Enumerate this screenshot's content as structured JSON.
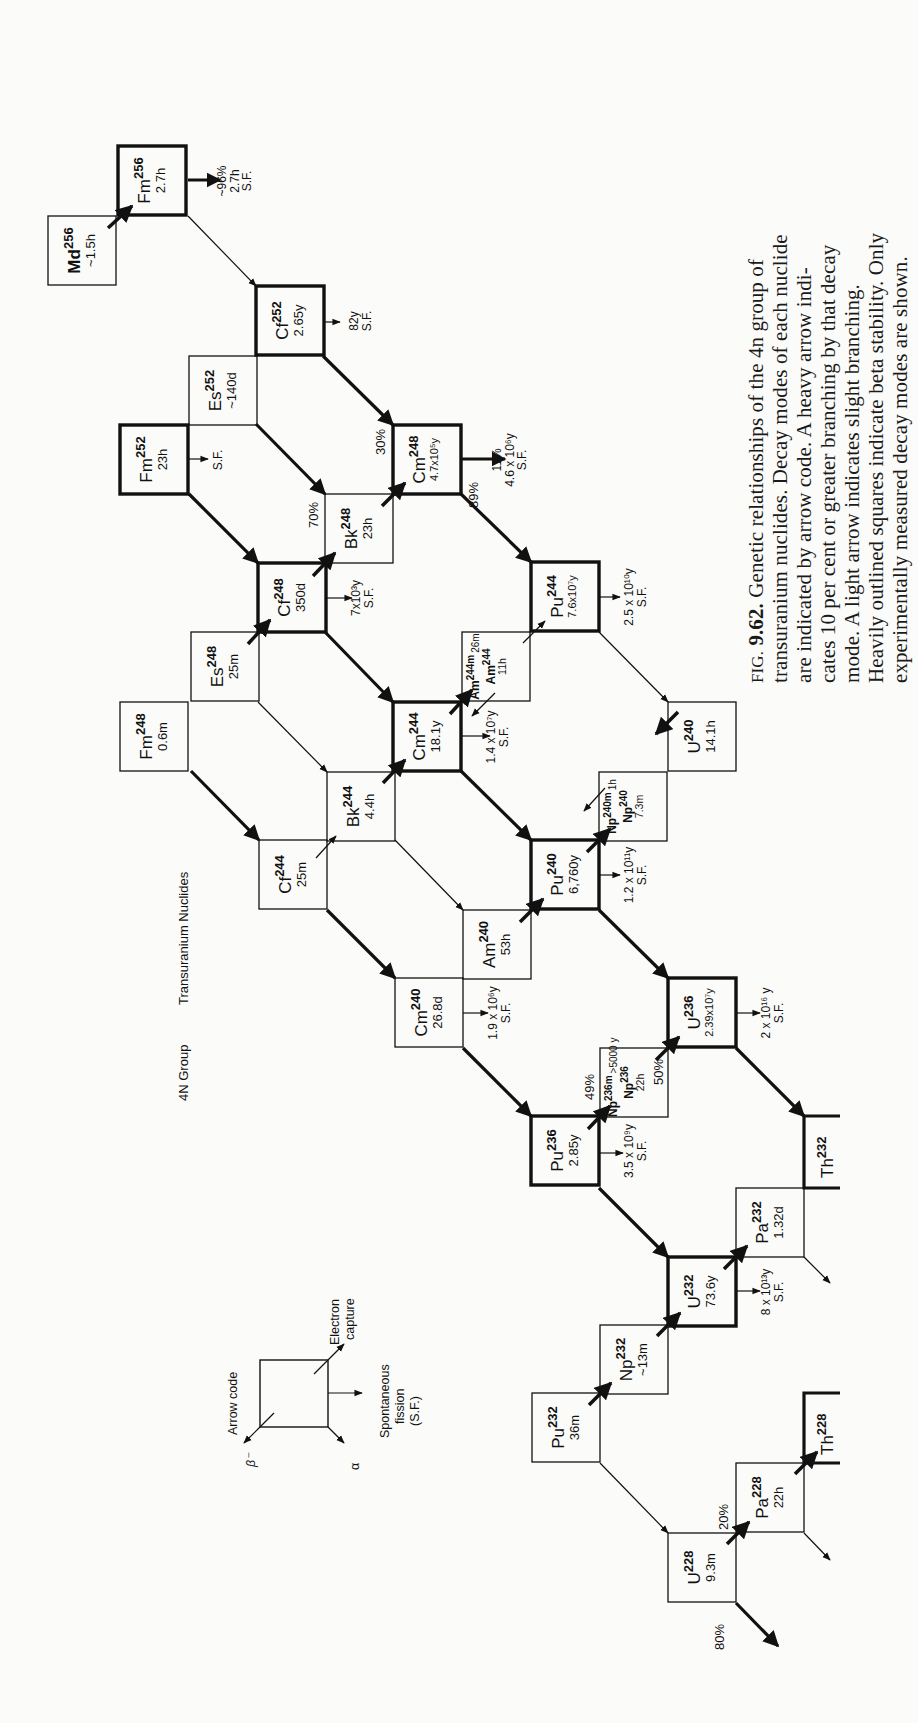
{
  "header": {
    "group_label": "4N Group",
    "title": "Transuranium Nuclides"
  },
  "legend": {
    "title": "Arrow code",
    "beta_minus": "β⁻",
    "alpha": "α",
    "spontaneous_fission": [
      "Spontaneous",
      "fission",
      "(S.F.)"
    ],
    "electron_capture": [
      "Electron",
      "capture"
    ]
  },
  "caption": {
    "fig_prefix": "FIG.",
    "fig_number": "9.62.",
    "lines": [
      "Genetic relationships of the 4n group of",
      "transuranium nuclides.   Decay modes of each nuclide",
      "are indicated by arrow code.   A heavy arrow indi-",
      "cates 10 per cent or greater branching by that decay",
      "mode.   A light arrow indicates slight branching.",
      "Heavily outlined squares indicate beta stability.  Only",
      "experimentally measured decay modes are shown."
    ]
  },
  "nuclides": [
    {
      "id": "md256",
      "symbol": "Md",
      "mass": "256",
      "halflife": "~1.5h",
      "heavy": false,
      "x": 48,
      "y": 216
    },
    {
      "id": "fm256",
      "symbol": "Fm",
      "mass": "256",
      "halflife": "2.7h",
      "heavy": true,
      "x": 118,
      "y": 146
    },
    {
      "id": "cf252",
      "symbol": "Cf",
      "mass": "252",
      "halflife": "2.65y",
      "heavy": true,
      "x": 256,
      "y": 286
    },
    {
      "id": "es252",
      "symbol": "Es",
      "mass": "252",
      "halflife": "~140d",
      "heavy": false,
      "x": 189,
      "y": 356
    },
    {
      "id": "fm252",
      "symbol": "Fm",
      "mass": "252",
      "halflife": "23h",
      "heavy": true,
      "x": 120,
      "y": 425
    },
    {
      "id": "bk248",
      "symbol": "Bk",
      "mass": "248",
      "halflife": "23h",
      "heavy": false,
      "x": 325,
      "y": 494
    },
    {
      "id": "cm248",
      "symbol": "Cm",
      "mass": "248",
      "halflife": "4.7x10⁵y",
      "heavy": true,
      "x": 393,
      "y": 425
    },
    {
      "id": "cf248",
      "symbol": "Cf",
      "mass": "248",
      "halflife": "350d",
      "heavy": true,
      "x": 258,
      "y": 563
    },
    {
      "id": "es248",
      "symbol": "Es",
      "mass": "248",
      "halflife": "25m",
      "heavy": false,
      "x": 191,
      "y": 632
    },
    {
      "id": "fm248",
      "symbol": "Fm",
      "mass": "248",
      "halflife": "0.6m",
      "heavy": false,
      "x": 120,
      "y": 702
    },
    {
      "id": "pu244",
      "symbol": "Pu",
      "mass": "244",
      "halflife": "7.6x10⁷y",
      "heavy": true,
      "x": 531,
      "y": 562
    },
    {
      "id": "am244",
      "symbol": "Am",
      "mass": "244",
      "halflife": "11h",
      "heavy": false,
      "x": 462,
      "y": 632,
      "isomer": {
        "label": "Am",
        "mass": "244m",
        "halflife": "26m"
      }
    },
    {
      "id": "cm244",
      "symbol": "Cm",
      "mass": "244",
      "halflife": "18.1y",
      "heavy": true,
      "x": 393,
      "y": 702
    },
    {
      "id": "u240",
      "symbol": "U",
      "mass": "240",
      "halflife": "14.1h",
      "heavy": false,
      "x": 668,
      "y": 702
    },
    {
      "id": "bk244",
      "symbol": "Bk",
      "mass": "244",
      "halflife": "4.4h",
      "heavy": false,
      "x": 327,
      "y": 772
    },
    {
      "id": "np240",
      "symbol": "Np",
      "mass": "240",
      "halflife": "7.3m",
      "heavy": false,
      "x": 599,
      "y": 772,
      "isomer": {
        "label": "Np",
        "mass": "240m",
        "halflife": "1h"
      }
    },
    {
      "id": "cf244",
      "symbol": "Cf",
      "mass": "244",
      "halflife": "25m",
      "heavy": false,
      "x": 259,
      "y": 840
    },
    {
      "id": "pu240",
      "symbol": "Pu",
      "mass": "240",
      "halflife": "6,760y",
      "heavy": true,
      "x": 531,
      "y": 840
    },
    {
      "id": "am240",
      "symbol": "Am",
      "mass": "240",
      "halflife": "53h",
      "heavy": false,
      "x": 463,
      "y": 910
    },
    {
      "id": "cm240",
      "symbol": "Cm",
      "mass": "240",
      "halflife": "26.8d",
      "heavy": false,
      "x": 395,
      "y": 978
    },
    {
      "id": "u236",
      "symbol": "U",
      "mass": "236",
      "halflife": "2.39x10⁷y",
      "heavy": true,
      "x": 668,
      "y": 978
    },
    {
      "id": "np236",
      "symbol": "Np",
      "mass": "236",
      "halflife": "22h",
      "heavy": false,
      "x": 600,
      "y": 1048,
      "isomer": {
        "label": "Np",
        "mass": "236m",
        "halflife": ">5000 y"
      }
    },
    {
      "id": "pu236",
      "symbol": "Pu",
      "mass": "236",
      "halflife": "2.85y",
      "heavy": true,
      "x": 531,
      "y": 1116
    },
    {
      "id": "pa232",
      "symbol": "Pa",
      "mass": "232",
      "halflife": "1.32d",
      "heavy": false,
      "x": 736,
      "y": 1188
    },
    {
      "id": "u232",
      "symbol": "U",
      "mass": "232",
      "halflife": "73.6y",
      "heavy": true,
      "x": 668,
      "y": 1257
    },
    {
      "id": "np232",
      "symbol": "Np",
      "mass": "232",
      "halflife": "~13m",
      "heavy": false,
      "x": 600,
      "y": 1325
    },
    {
      "id": "pu232",
      "symbol": "Pu",
      "mass": "232",
      "halflife": "36m",
      "heavy": false,
      "x": 532,
      "y": 1393
    },
    {
      "id": "pa228",
      "symbol": "Pa",
      "mass": "228",
      "halflife": "22h",
      "heavy": false,
      "x": 736,
      "y": 1463
    },
    {
      "id": "u228",
      "symbol": "U",
      "mass": "228",
      "halflife": "9.3m",
      "heavy": false,
      "x": 668,
      "y": 1533
    }
  ],
  "partial_nuclides": [
    {
      "id": "th232",
      "symbol": "Th",
      "mass": "232",
      "x": 804,
      "y": 1116
    },
    {
      "id": "th228",
      "symbol": "Th",
      "mass": "228",
      "x": 804,
      "y": 1393
    }
  ],
  "sf_labels": [
    {
      "for": "fm256",
      "lines": [
        "~96%",
        "2.7h",
        "S.F."
      ]
    },
    {
      "for": "cf252",
      "lines": [
        "82y",
        "S.F."
      ]
    },
    {
      "for": "fm252",
      "lines": [
        "S.F."
      ]
    },
    {
      "for": "cm248",
      "lines": [
        "11%",
        "4.6 x 10⁶y",
        "S.F."
      ]
    },
    {
      "for": "cf248",
      "lines": [
        "7x10³y",
        "S.F."
      ]
    },
    {
      "for": "pu244",
      "lines": [
        "2.5 x 10¹⁰y",
        "S.F."
      ]
    },
    {
      "for": "cm244",
      "lines": [
        "1.4 x 10⁷y",
        "S.F."
      ]
    },
    {
      "for": "pu240",
      "lines": [
        "1.2 x 10¹¹y",
        "S.F."
      ]
    },
    {
      "for": "cm240",
      "lines": [
        "1.9 x 10⁶y",
        "S.F."
      ]
    },
    {
      "for": "u236",
      "lines": [
        "2 x 10¹⁶ y",
        "S.F."
      ]
    },
    {
      "for": "pu236",
      "lines": [
        "3.5 x 10⁹y",
        "S.F."
      ]
    },
    {
      "for": "u232",
      "lines": [
        "8 x 10¹³y",
        "S.F."
      ]
    }
  ],
  "branch_labels": [
    {
      "text": "70%",
      "near": "bk248"
    },
    {
      "text": "30%",
      "near": "cm248"
    },
    {
      "text": "89%",
      "near": "cm248"
    },
    {
      "text": "49%",
      "near": "pu236"
    },
    {
      "text": "50%",
      "near": "u236"
    },
    {
      "text": "20%",
      "near": "u228"
    },
    {
      "text": "80%",
      "near": "u228"
    }
  ]
}
